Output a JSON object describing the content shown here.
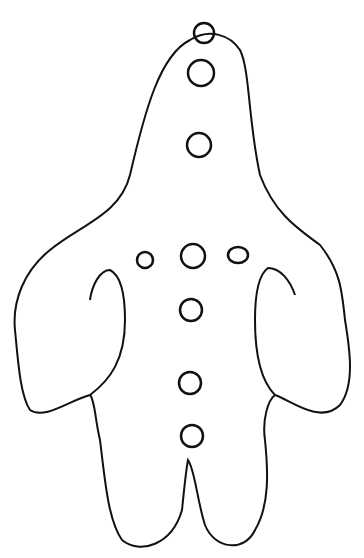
{
  "drawing": {
    "subject": "outline figure with circles",
    "stroke_color": "#111111",
    "background": "#ffffff",
    "circles": [
      {
        "cx": 204,
        "cy": 33,
        "r": 10
      },
      {
        "cx": 201,
        "cy": 73,
        "r": 13
      },
      {
        "cx": 199,
        "cy": 145,
        "r": 12
      },
      {
        "cx": 145,
        "cy": 260,
        "r": 8
      },
      {
        "cx": 193,
        "cy": 256,
        "r": 12
      },
      {
        "cx": 238,
        "cy": 255,
        "r": 9
      },
      {
        "cx": 191,
        "cy": 310,
        "r": 11
      },
      {
        "cx": 190,
        "cy": 383,
        "r": 11
      },
      {
        "cx": 192,
        "cy": 436,
        "r": 11
      }
    ]
  }
}
